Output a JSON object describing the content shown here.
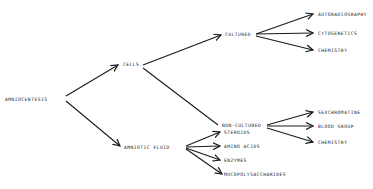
{
  "diagram": {
    "type": "tree",
    "root": {
      "label": "AMNIOCENTESIS",
      "x": 5,
      "y": 97
    },
    "nodes": [
      {
        "id": "cells",
        "label": "CELLS",
        "x": 123,
        "y": 62
      },
      {
        "id": "amniotic_fluid",
        "label": "AMNIOTIC FLUID",
        "x": 124,
        "y": 145
      },
      {
        "id": "cultured",
        "label": "CULTURED",
        "x": 225,
        "y": 32
      },
      {
        "id": "non_cultured",
        "label": "NON-CULTURED",
        "x": 222,
        "y": 123
      },
      {
        "id": "autoradiography",
        "label": "AUTORADIOGRAPHY",
        "x": 318,
        "y": 12
      },
      {
        "id": "cytogenetics",
        "label": "CYTOGENETICS",
        "x": 318,
        "y": 31
      },
      {
        "id": "chemistry1",
        "label": "CHEMISTRY",
        "x": 318,
        "y": 48
      },
      {
        "id": "sexchromatine",
        "label": "SEXCHROMATINE",
        "x": 318,
        "y": 110
      },
      {
        "id": "blood_group",
        "label": "BLOOD GROUP",
        "x": 318,
        "y": 124
      },
      {
        "id": "chemistry2",
        "label": "CHEMISTRY",
        "x": 318,
        "y": 140
      },
      {
        "id": "steroids",
        "label": "STEROIDS",
        "x": 224,
        "y": 130
      },
      {
        "id": "amino_acids",
        "label": "AMINO ACIDS",
        "x": 224,
        "y": 144
      },
      {
        "id": "enzymes",
        "label": "ENZYMES",
        "x": 224,
        "y": 158
      },
      {
        "id": "mucopolysaccharides",
        "label": "MUCOPOLYSACCHARIDES",
        "x": 224,
        "y": 172
      }
    ],
    "edges": [
      {
        "from": "AMNIOCENTESIS",
        "to": "CELLS"
      },
      {
        "from": "AMNIOCENTESIS",
        "to": "AMNIOTIC FLUID"
      },
      {
        "from": "CELLS",
        "to": "CULTURED"
      },
      {
        "from": "CELLS",
        "to": "NON-CULTURED"
      },
      {
        "from": "CULTURED",
        "to": "AUTORADIOGRAPHY"
      },
      {
        "from": "CULTURED",
        "to": "CYTOGENETICS"
      },
      {
        "from": "CULTURED",
        "to": "CHEMISTRY"
      },
      {
        "from": "NON-CULTURED",
        "to": "SEXCHROMATINE"
      },
      {
        "from": "NON-CULTURED",
        "to": "BLOOD GROUP"
      },
      {
        "from": "NON-CULTURED",
        "to": "CHEMISTRY"
      },
      {
        "from": "AMNIOTIC FLUID",
        "to": "STEROIDS"
      },
      {
        "from": "AMNIOTIC FLUID",
        "to": "AMINO ACIDS"
      },
      {
        "from": "AMNIOTIC FLUID",
        "to": "ENZYMES"
      },
      {
        "from": "AMNIOTIC FLUID",
        "to": "MUCOPOLYSACCHARIDES"
      }
    ],
    "colors": {
      "line": "#1a1a1a",
      "text": "#222222",
      "background": "#ffffff"
    }
  }
}
